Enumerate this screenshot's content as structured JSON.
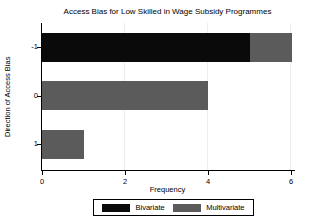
{
  "chart_data": {
    "type": "bar",
    "orientation": "horizontal",
    "stacked": true,
    "title": "Access Bias for Low Skilled in Wage Subsidy Programmes",
    "xlabel": "Frequency",
    "ylabel": "Direction of Access Bias",
    "categories": [
      "-1",
      "0",
      "1"
    ],
    "series": [
      {
        "name": "Bivariate",
        "color": "#0a0a0a",
        "values": [
          5,
          0,
          0
        ]
      },
      {
        "name": "Multivariate",
        "color": "#5b5b5b",
        "values": [
          1,
          4,
          1
        ]
      }
    ],
    "xlim": [
      0,
      6
    ],
    "xticks": [
      0,
      2,
      4,
      6
    ],
    "grid": "vertical",
    "gridline_color": "#ededed",
    "axis_color": "#000000",
    "background_color": "#ffffff",
    "legend_position": "bottom"
  }
}
